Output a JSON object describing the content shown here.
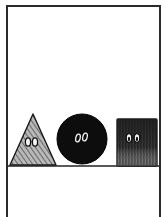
{
  "panel": {
    "description": "Comic panel with three shape characters on a ground line",
    "colors": {
      "background": "#ffffff",
      "ink": "#1a1a1a",
      "frame": "#2b2b2b",
      "triangle_fill": "#8a8a8a",
      "circle_fill": "#0d0d0d",
      "square_fill": "#3a3a3a",
      "eye_white": "#f4f4f4"
    },
    "characters": [
      {
        "shape": "triangle",
        "label": "Triangle character",
        "texture": "diagonal hatching"
      },
      {
        "shape": "circle",
        "label": "Circle character",
        "texture": "solid black"
      },
      {
        "shape": "square",
        "label": "Square character",
        "texture": "vertical scribble"
      }
    ]
  }
}
